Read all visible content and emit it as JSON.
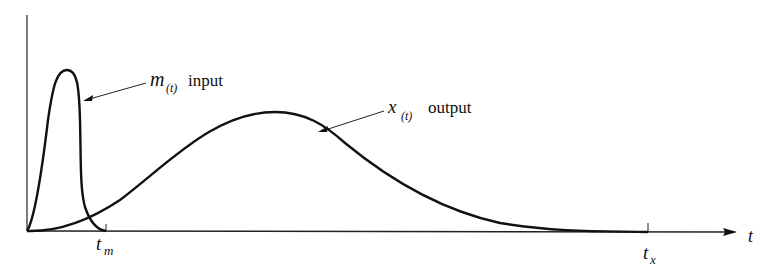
{
  "diagram": {
    "type": "response-curve",
    "axes": {
      "x_label": "t",
      "y_label": ""
    },
    "ticks": {
      "t_m": {
        "base": "t",
        "sub": "m"
      },
      "t_x": {
        "base": "t",
        "sub": "x"
      }
    },
    "curves": [
      {
        "name": "input",
        "symbol": "m",
        "arg": "(t)",
        "label": "input"
      },
      {
        "name": "output",
        "symbol": "x",
        "arg": "(t)",
        "label": "output"
      }
    ]
  }
}
